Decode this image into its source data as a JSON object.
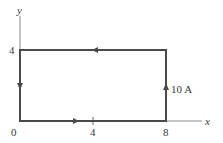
{
  "diagram": {
    "type": "current-loop",
    "axes": {
      "x_label": "x",
      "y_label": "y",
      "x_ticks": [
        "0",
        "4",
        "8"
      ],
      "y_ticks": [
        "4"
      ]
    },
    "loop": {
      "corners": [
        [
          0,
          0
        ],
        [
          8,
          0
        ],
        [
          8,
          4
        ],
        [
          0,
          4
        ]
      ],
      "current_label": "10 A",
      "direction": "counterclockwise"
    },
    "colors": {
      "line": "#4a4a4a",
      "axis": "#7a7a7a"
    }
  }
}
